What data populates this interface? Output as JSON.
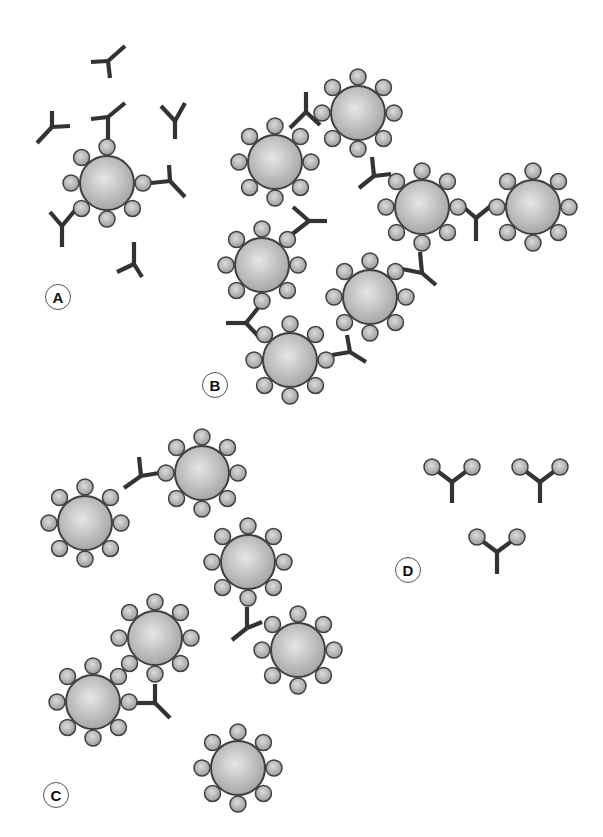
{
  "style": {
    "antibody_color": "#333333",
    "bead_outline": "#3f3f3f",
    "bead_light": "#e6e6e6",
    "bead_dark": "#a4a4a4",
    "antigen_radius": 8,
    "bead_radius": 27,
    "antigen_distance": 36
  },
  "panels": [
    {
      "label": "A",
      "label_pos": [
        58,
        297
      ],
      "description": "Single particle with free antibodies",
      "beads": [
        {
          "c": [
            107,
            183
          ],
          "missing": [
            45
          ]
        }
      ],
      "antibodies": [
        {
          "j": [
            108,
            61
          ],
          "a1": [
            91,
            62
          ],
          "a2": [
            125,
            46
          ],
          "s": [
            110,
            78
          ]
        },
        {
          "j": [
            108,
            117
          ],
          "a1": [
            91,
            119
          ],
          "a2": [
            125,
            103
          ],
          "s": [
            108,
            139
          ]
        },
        {
          "j": [
            52,
            127
          ],
          "a1": [
            52,
            111
          ],
          "a2": [
            70,
            126
          ],
          "s": [
            37,
            143
          ]
        },
        {
          "j": [
            175,
            121
          ],
          "a1": [
            161,
            106
          ],
          "a2": [
            185,
            103
          ],
          "s": [
            175,
            139
          ]
        },
        {
          "j": [
            170,
            181
          ],
          "a1": [
            169,
            165
          ],
          "a2": [
            185,
            197
          ],
          "s": [
            151,
            183
          ]
        },
        {
          "j": [
            62,
            226
          ],
          "a1": [
            50,
            212
          ],
          "a2": [
            76,
            209
          ],
          "s": [
            62,
            247
          ]
        },
        {
          "j": [
            134,
            264
          ],
          "a1": [
            134,
            242
          ],
          "a2": [
            142,
            277
          ],
          "s": [
            117,
            272
          ]
        }
      ]
    },
    {
      "label": "B",
      "label_pos": [
        215,
        385
      ],
      "description": "Agglutination lattice",
      "beads": [
        {
          "c": [
            358,
            113
          ],
          "missing": []
        },
        {
          "c": [
            275,
            162
          ],
          "missing": []
        },
        {
          "c": [
            422,
            207
          ],
          "missing": []
        },
        {
          "c": [
            533,
            207
          ],
          "missing": []
        },
        {
          "c": [
            262,
            265
          ],
          "missing": []
        },
        {
          "c": [
            370,
            297
          ],
          "missing": []
        },
        {
          "c": [
            290,
            360
          ],
          "missing": []
        }
      ],
      "antibodies": [
        {
          "j": [
            306,
            112
          ],
          "a1": [
            290,
            128
          ],
          "a2": [
            320,
            125
          ],
          "s": [
            306,
            92
          ]
        },
        {
          "j": [
            374,
            176
          ],
          "a1": [
            359,
            188
          ],
          "a2": [
            391,
            174
          ],
          "s": [
            372,
            157
          ]
        },
        {
          "j": [
            309,
            221
          ],
          "a1": [
            291,
            235
          ],
          "a2": [
            327,
            221
          ],
          "s": [
            293,
            207
          ]
        },
        {
          "j": [
            476,
            218
          ],
          "a1": [
            461,
            205
          ],
          "a2": [
            492,
            205
          ],
          "s": [
            476,
            241
          ]
        },
        {
          "j": [
            422,
            273
          ],
          "a1": [
            402,
            269
          ],
          "a2": [
            436,
            285
          ],
          "s": [
            420,
            252
          ]
        },
        {
          "j": [
            246,
            323
          ],
          "a1": [
            226,
            323
          ],
          "a2": [
            260,
            338
          ],
          "s": [
            262,
            303
          ]
        },
        {
          "j": [
            350,
            352
          ],
          "a1": [
            332,
            355
          ],
          "a2": [
            366,
            362
          ],
          "s": [
            347,
            335
          ]
        }
      ]
    },
    {
      "label": "C",
      "label_pos": [
        56,
        795
      ],
      "description": "Partial agglutination with antibody deficit",
      "beads": [
        {
          "c": [
            202,
            473
          ],
          "missing": []
        },
        {
          "c": [
            85,
            523
          ],
          "missing": []
        },
        {
          "c": [
            248,
            562
          ],
          "missing": []
        },
        {
          "c": [
            298,
            650
          ],
          "missing": []
        },
        {
          "c": [
            155,
            638
          ],
          "missing": []
        },
        {
          "c": [
            93,
            702
          ],
          "missing": []
        },
        {
          "c": [
            238,
            768
          ],
          "missing": []
        }
      ],
      "antibodies": [
        {
          "j": [
            141,
            476
          ],
          "a1": [
            124,
            488
          ],
          "a2": [
            159,
            473
          ],
          "s": [
            139,
            457
          ]
        },
        {
          "j": [
            247,
            628
          ],
          "a1": [
            232,
            640
          ],
          "a2": [
            262,
            622
          ],
          "s": [
            247,
            607
          ]
        },
        {
          "j": [
            155,
            703
          ],
          "a1": [
            137,
            703
          ],
          "a2": [
            170,
            718
          ],
          "s": [
            155,
            684
          ]
        }
      ]
    },
    {
      "label": "D",
      "label_pos": [
        408,
        570
      ],
      "description": "Antibodies saturated with free antigen",
      "beads": [],
      "antibodies": [
        {
          "j": [
            452,
            482
          ],
          "a1": [
            432,
            467
          ],
          "a2": [
            472,
            467
          ],
          "s": [
            452,
            503
          ],
          "ag": true
        },
        {
          "j": [
            540,
            482
          ],
          "a1": [
            520,
            467
          ],
          "a2": [
            560,
            467
          ],
          "s": [
            540,
            503
          ],
          "ag": true
        },
        {
          "j": [
            497,
            552
          ],
          "a1": [
            477,
            537
          ],
          "a2": [
            517,
            537
          ],
          "s": [
            497,
            574
          ],
          "ag": true
        }
      ]
    }
  ]
}
